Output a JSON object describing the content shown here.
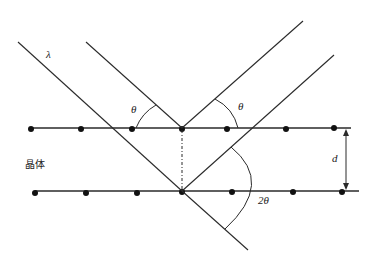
{
  "diagram": {
    "title": "",
    "labels": {
      "wavelength": "λ",
      "incident_angle": "θ",
      "reflected_angle": "θ",
      "spacing": "d",
      "deflection_angle": "2θ",
      "crystal": "晶体"
    },
    "colors": {
      "line": "#2a2a2a",
      "dot": "#111111",
      "background": "#ffffff"
    },
    "planes": [
      {
        "y": 128,
        "x_start": 31,
        "x_end": 351,
        "atoms_x": [
          31,
          81,
          132,
          182,
          227,
          286,
          334
        ]
      },
      {
        "y": 191,
        "x_start": 35,
        "x_end": 359,
        "atoms_x": [
          35,
          86,
          137,
          182,
          232,
          293,
          342
        ]
      }
    ]
  }
}
